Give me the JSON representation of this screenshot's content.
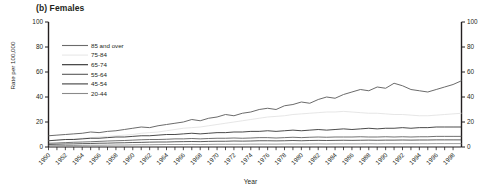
{
  "panel": {
    "title": "(b) Females"
  },
  "axes": {
    "ylabel": "Rate per 100,000",
    "xlabel": "Year",
    "y_ticks": [
      "0",
      "20",
      "40",
      "60",
      "80",
      "100"
    ],
    "y_ticks_right": [
      "0",
      "20",
      "40",
      "60",
      "80",
      "100"
    ]
  },
  "legend": {
    "items": [
      {
        "label": "85 and over",
        "color": "#6b6b6b"
      },
      {
        "label": "75-84",
        "color": "#e2e2e2"
      },
      {
        "label": "65-74",
        "color": "#2b2b2b"
      },
      {
        "label": "55-64",
        "color": "#585858"
      },
      {
        "label": "45-54",
        "color": "#404040"
      },
      {
        "label": "20-44",
        "color": "#8a8a8a"
      }
    ]
  },
  "chart_data": {
    "type": "line",
    "title": "(b) Females",
    "xlabel": "Year",
    "ylabel": "Rate per 100,000",
    "ylim": [
      0,
      100
    ],
    "xlim": [
      1950,
      1999
    ],
    "grid": false,
    "legend_position": "upper-left-inside",
    "x": [
      1950,
      1951,
      1952,
      1953,
      1954,
      1955,
      1956,
      1957,
      1958,
      1959,
      1960,
      1961,
      1962,
      1963,
      1964,
      1965,
      1966,
      1967,
      1968,
      1969,
      1970,
      1971,
      1972,
      1973,
      1974,
      1975,
      1976,
      1977,
      1978,
      1979,
      1980,
      1981,
      1982,
      1983,
      1984,
      1985,
      1986,
      1987,
      1988,
      1989,
      1990,
      1991,
      1992,
      1993,
      1994,
      1995,
      1996,
      1997,
      1998,
      1999
    ],
    "tick_labels_x": [
      "1950",
      "1952",
      "1954",
      "1956",
      "1958",
      "1960",
      "1962",
      "1964",
      "1966",
      "1968",
      "1970",
      "1972",
      "1974",
      "1976",
      "1978",
      "1980",
      "1982",
      "1984",
      "1986",
      "1988",
      "1990",
      "1992",
      "1994",
      "1996",
      "1998"
    ],
    "series": [
      {
        "name": "85 and over",
        "color": "#6b6b6b",
        "values": [
          9,
          9.5,
          10,
          10.5,
          11,
          12,
          11.5,
          12.5,
          13,
          14,
          15,
          16,
          15.5,
          17,
          18,
          19,
          20,
          22,
          21,
          23,
          24,
          26,
          25,
          27,
          28,
          30,
          31,
          30,
          33,
          34,
          36,
          35,
          38,
          40,
          39,
          42,
          44,
          46,
          45,
          48,
          47,
          51,
          49,
          46,
          45,
          44,
          46,
          48,
          50,
          53
        ]
      },
      {
        "name": "75-84",
        "color": "#e2e2e2",
        "values": [
          5,
          5.5,
          6,
          6.5,
          7,
          7.5,
          8,
          8.5,
          9,
          9.5,
          10,
          11,
          11.5,
          12,
          13,
          14,
          15,
          15.5,
          16,
          17,
          18,
          19,
          20,
          21,
          22,
          23,
          24,
          24.5,
          25,
          26,
          26.5,
          27,
          27.5,
          28,
          28,
          28.5,
          28,
          27.5,
          27,
          27,
          26.5,
          26,
          26,
          25.5,
          25,
          25,
          25.5,
          26,
          26.5,
          27
        ]
      },
      {
        "name": "65-74",
        "color": "#2b2b2b",
        "values": [
          5,
          5.5,
          6,
          6,
          6.5,
          7,
          7,
          7.5,
          8,
          8,
          8.5,
          9,
          9,
          9.5,
          10,
          10,
          10.5,
          11,
          10.5,
          11,
          11.5,
          11.5,
          12,
          12,
          12.5,
          12.5,
          13,
          12.5,
          13,
          13.5,
          13,
          13.5,
          14,
          13.5,
          14,
          14.5,
          14,
          14.5,
          15,
          14.5,
          15,
          15,
          15.5,
          15,
          15.5,
          15.5,
          16,
          16,
          16,
          16
        ]
      },
      {
        "name": "55-64",
        "color": "#585858",
        "values": [
          3,
          3.2,
          3.5,
          3.8,
          4,
          4.2,
          4.5,
          4.8,
          5,
          5.2,
          5.5,
          5.8,
          6,
          6,
          6.2,
          6.5,
          6.5,
          6.8,
          6.5,
          6.8,
          7,
          7,
          7.2,
          7,
          7.2,
          7.5,
          7.5,
          7.2,
          7.5,
          7.8,
          7.5,
          7.8,
          8,
          7.8,
          8,
          8,
          8,
          8.2,
          8,
          8,
          8.2,
          8,
          8.2,
          8,
          8.2,
          8.2,
          8.5,
          8.5,
          8.5,
          8.5
        ]
      },
      {
        "name": "45-54",
        "color": "#404040",
        "values": [
          2,
          2.2,
          2.4,
          2.5,
          2.7,
          2.8,
          3,
          3.1,
          3.3,
          3.4,
          3.6,
          3.7,
          3.9,
          4,
          4,
          4.2,
          4.3,
          4.4,
          4.3,
          4.5,
          4.6,
          4.6,
          4.8,
          4.7,
          4.8,
          5,
          5,
          4.9,
          5,
          5.2,
          5,
          5.2,
          5.3,
          5.2,
          5.3,
          5.4,
          5.3,
          5.4,
          5.5,
          5.4,
          5.5,
          5.5,
          5.6,
          5.5,
          5.6,
          5.6,
          5.7,
          5.7,
          5.7,
          5.7
        ]
      },
      {
        "name": "20-44",
        "color": "#8a8a8a",
        "values": [
          1,
          1.1,
          1.2,
          1.2,
          1.3,
          1.4,
          1.4,
          1.5,
          1.6,
          1.6,
          1.7,
          1.8,
          1.8,
          1.9,
          2,
          2,
          2,
          2.1,
          2,
          2.1,
          2.2,
          2.2,
          2.2,
          2.2,
          2.3,
          2.3,
          2.3,
          2.3,
          2.4,
          2.4,
          2.4,
          2.4,
          2.5,
          2.4,
          2.5,
          2.5,
          2.5,
          2.5,
          2.6,
          2.5,
          2.6,
          2.6,
          2.6,
          2.6,
          2.6,
          2.6,
          2.7,
          2.7,
          2.7,
          2.7
        ]
      }
    ]
  }
}
